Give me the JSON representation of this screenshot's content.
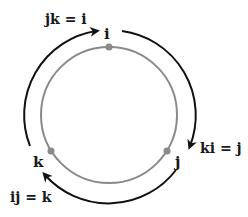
{
  "diagram": {
    "nodes": [
      {
        "id": "i",
        "label": "i"
      },
      {
        "id": "j",
        "label": "j"
      },
      {
        "id": "k",
        "label": "k"
      }
    ],
    "relations": [
      {
        "label": "jk = i"
      },
      {
        "label": "ki = j"
      },
      {
        "label": "ij = k"
      }
    ],
    "colors": {
      "circle": "#8a8a8a",
      "dot": "#8a8a8a",
      "arrow": "#111111"
    }
  }
}
